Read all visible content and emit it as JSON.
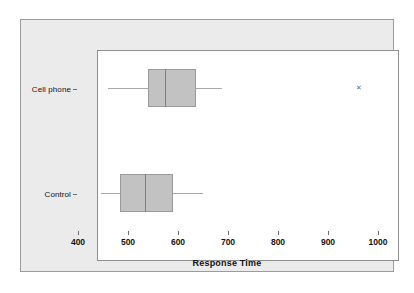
{
  "chart_data": {
    "type": "box",
    "title": "",
    "xlabel": "Response Time",
    "ylabel": "",
    "xlim": [
      400,
      1000
    ],
    "xticks": [
      400,
      500,
      600,
      700,
      800,
      900,
      1000
    ],
    "xticklabels": [
      "400",
      "500",
      "600",
      "700",
      "800",
      "900",
      "1000"
    ],
    "grid": false,
    "orientation": "horizontal",
    "categories": [
      "Cell phone",
      "Control"
    ],
    "boxes": [
      {
        "category": "Cell phone",
        "whisker_low": 462,
        "q1": 542,
        "median": 576,
        "q3": 638,
        "whisker_high": 690,
        "outliers": [
          962
        ]
      },
      {
        "category": "Control",
        "whisker_low": 448,
        "q1": 486,
        "median": 536,
        "q3": 592,
        "whisker_high": 652,
        "outliers": []
      }
    ],
    "colors": {
      "box_fill": "#c2c2c2",
      "box_edge": "#9a9a9a",
      "median": "#7d7d7d",
      "whisker": "#a8a8a8",
      "outlier": "#6e6e6e",
      "panel_background": "#ebebeb",
      "plot_background": "#ffffff",
      "axis": "#6d6d6d",
      "text": "#111111"
    },
    "outlier_marker": "outlier-marker-x",
    "outlier_glyph": "✕"
  },
  "axis": {
    "x_title": "Response Time"
  }
}
